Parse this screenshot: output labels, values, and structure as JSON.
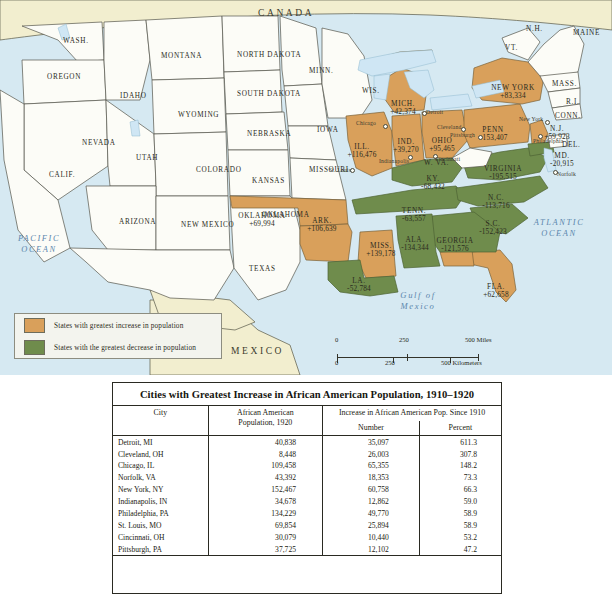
{
  "map": {
    "countries": [
      {
        "name": "CANADA",
        "x": 258,
        "y": 8
      },
      {
        "name": "MEXICO",
        "x": 231,
        "y": 346
      }
    ],
    "oceans": [
      {
        "name": "PACIFIC OCEAN",
        "x": 8,
        "y": 238,
        "size": 8.4
      },
      {
        "name": "ATLANTIC OCEAN",
        "x": 520,
        "y": 222,
        "size": 8.4
      },
      {
        "name": "Gulf of Mexico",
        "x": 404,
        "y": 295,
        "size": 8.6
      }
    ],
    "plain_states": [
      {
        "label": "WASH.",
        "x": 63,
        "y": 38
      },
      {
        "label": "OREGON",
        "x": 47,
        "y": 74
      },
      {
        "label": "IDAHO",
        "x": 120,
        "y": 93
      },
      {
        "label": "MONTANA",
        "x": 161,
        "y": 53
      },
      {
        "label": "NORTH DAKOTA",
        "x": 237,
        "y": 52
      },
      {
        "label": "SOUTH DAKOTA",
        "x": 237,
        "y": 91
      },
      {
        "label": "WYOMING",
        "x": 178,
        "y": 112
      },
      {
        "label": "NEVADA",
        "x": 82,
        "y": 140
      },
      {
        "label": "UTAH",
        "x": 136,
        "y": 155
      },
      {
        "label": "COLORADO",
        "x": 196,
        "y": 167
      },
      {
        "label": "NEBRASKA",
        "x": 247,
        "y": 131
      },
      {
        "label": "KANSAS",
        "x": 252,
        "y": 178
      },
      {
        "label": "CALIF.",
        "x": 49,
        "y": 172
      },
      {
        "label": "ARIZONA",
        "x": 119,
        "y": 219
      },
      {
        "label": "NEW MEXICO",
        "x": 181,
        "y": 222
      },
      {
        "label": "TEXAS",
        "x": 249,
        "y": 266
      },
      {
        "label": "OKLAHOMA",
        "x": 262,
        "y": 212
      },
      {
        "label": "MINN.",
        "x": 309,
        "y": 68
      },
      {
        "label": "IOWA",
        "x": 317,
        "y": 127
      },
      {
        "label": "WIS.",
        "x": 362,
        "y": 88
      },
      {
        "label": "MISSOURI",
        "x": 309,
        "y": 167
      },
      {
        "label": "MASS.",
        "x": 552,
        "y": 81
      },
      {
        "label": "R.I.",
        "x": 566,
        "y": 99
      },
      {
        "label": "CONN.",
        "x": 555,
        "y": 113
      },
      {
        "label": "DEL.",
        "x": 562,
        "y": 142
      },
      {
        "label": "MAINE",
        "x": 573,
        "y": 30
      },
      {
        "label": "N.H.",
        "x": 526,
        "y": 26
      },
      {
        "label": "VT.",
        "x": 505,
        "y": 45
      },
      {
        "label": "W. VA.",
        "x": 424,
        "y": 160
      }
    ],
    "increase_states": [
      {
        "name": "MICH.",
        "value": "+42,374",
        "x": 403,
        "y": 100
      },
      {
        "name": "ILL.",
        "value": "+116,476",
        "x": 362,
        "y": 143
      },
      {
        "name": "IND.",
        "value": "+39,270",
        "x": 406,
        "y": 138
      },
      {
        "name": "OHIO",
        "value": "+95,465",
        "x": 442,
        "y": 137
      },
      {
        "name": "PENN",
        "value": "+153,407",
        "x": 493,
        "y": 126
      },
      {
        "name": "NEW YORK",
        "value": "+83,334",
        "x": 513,
        "y": 84
      },
      {
        "name": "N.J.",
        "value": "+59,923",
        "x": 557,
        "y": 125
      },
      {
        "name": "OKLAHOMA",
        "value": "+69,994",
        "x": 262,
        "y": 212
      },
      {
        "name": "ARK.",
        "value": "+106,639",
        "x": 322,
        "y": 217
      },
      {
        "name": "MISS.",
        "value": "+139,178",
        "x": 381,
        "y": 242
      },
      {
        "name": "FLA.",
        "value": "+62,658",
        "x": 496,
        "y": 283
      }
    ],
    "decrease_states": [
      {
        "name": "KY.",
        "value": "-68,432",
        "x": 433,
        "y": 175
      },
      {
        "name": "TENN.",
        "value": "-63,557",
        "x": 414,
        "y": 207
      },
      {
        "name": "VIRGINIA",
        "value": "-195,515",
        "x": 503,
        "y": 165
      },
      {
        "name": "N.C.",
        "value": "-113,716",
        "x": 496,
        "y": 194
      },
      {
        "name": "S.C.",
        "value": "-152,423",
        "x": 493,
        "y": 220
      },
      {
        "name": "GEORGIA",
        "value": "-121,576",
        "x": 455,
        "y": 237
      },
      {
        "name": "ALA.",
        "value": "-134,344",
        "x": 415,
        "y": 236
      },
      {
        "name": "LA.",
        "value": "-52,784",
        "x": 359,
        "y": 277
      },
      {
        "name": "MD.",
        "value": "-20,915",
        "x": 562,
        "y": 152
      }
    ],
    "cities": [
      {
        "name": "Chicago",
        "lx": 356,
        "ly": 120,
        "dx": 383,
        "dy": 124
      },
      {
        "name": "Detroit",
        "lx": 426,
        "ly": 109,
        "dx": 422,
        "dy": 111
      },
      {
        "name": "Cleveland",
        "lx": 437,
        "ly": 124,
        "dx": 461,
        "dy": 127
      },
      {
        "name": "Pittsburgh",
        "lx": 450,
        "ly": 132,
        "dx": 478,
        "dy": 135
      },
      {
        "name": "Indianapolis",
        "lx": 379,
        "ly": 158,
        "dx": 408,
        "dy": 155
      },
      {
        "name": "Cincinnati",
        "lx": 435,
        "ly": 156,
        "dx": 433,
        "dy": 154
      },
      {
        "name": "St. Louis",
        "lx": 329,
        "ly": 167,
        "dx": 350,
        "dy": 168
      },
      {
        "name": "New York",
        "lx": 519,
        "ly": 116,
        "dx": 545,
        "dy": 120
      },
      {
        "name": "Philadelphia",
        "lx": 533,
        "ly": 138,
        "dx": 538,
        "dy": 134
      },
      {
        "name": "Norfolk",
        "lx": 557,
        "ly": 171,
        "dx": 553,
        "dy": 170
      }
    ]
  },
  "legend": {
    "increase_label": "States with greatest increase in population",
    "decrease_label": "States with the greatest decrease in population",
    "increase_color": "#d9a05b",
    "decrease_color": "#6f8c4c"
  },
  "scale": {
    "miles": {
      "t0": "0",
      "t1": "250",
      "t2": "500 Miles"
    },
    "kilometers": {
      "t0": "0",
      "t1": "250",
      "t2": "500 Kilometers"
    }
  },
  "table": {
    "title": "Cities with Greatest Increase in African American Population, 1910–1920",
    "headers": {
      "city": "City",
      "pop_line1": "African American",
      "pop_line2": "Population, 1920",
      "increase_group": "Increase in African American Pop. Since 1910",
      "number": "Number",
      "percent": "Percent"
    },
    "rows": [
      {
        "city": "Detroit, MI",
        "pop": "40,838",
        "number": "35,097",
        "percent": "611.3"
      },
      {
        "city": "Cleveland, OH",
        "pop": "8,448",
        "number": "26,003",
        "percent": "307.8"
      },
      {
        "city": "Chicago, IL",
        "pop": "109,458",
        "number": "65,355",
        "percent": "148.2"
      },
      {
        "city": "Norfolk, VA",
        "pop": "43,392",
        "number": "18,353",
        "percent": "73.3"
      },
      {
        "city": "New York, NY",
        "pop": "152,467",
        "number": "60,758",
        "percent": "66.3"
      },
      {
        "city": "Indianapolis, IN",
        "pop": "34,678",
        "number": "12,862",
        "percent": "59.0"
      },
      {
        "city": "Philadelphia, PA",
        "pop": "134,229",
        "number": "49,770",
        "percent": "58.9"
      },
      {
        "city": "St. Louis, MO",
        "pop": "69,854",
        "number": "25,894",
        "percent": "58.9"
      },
      {
        "city": "Cincinnati, OH",
        "pop": "30,079",
        "number": "10,440",
        "percent": "53.2"
      },
      {
        "city": "Pittsburgh, PA",
        "pop": "37,725",
        "number": "12,102",
        "percent": "47.2"
      }
    ]
  }
}
